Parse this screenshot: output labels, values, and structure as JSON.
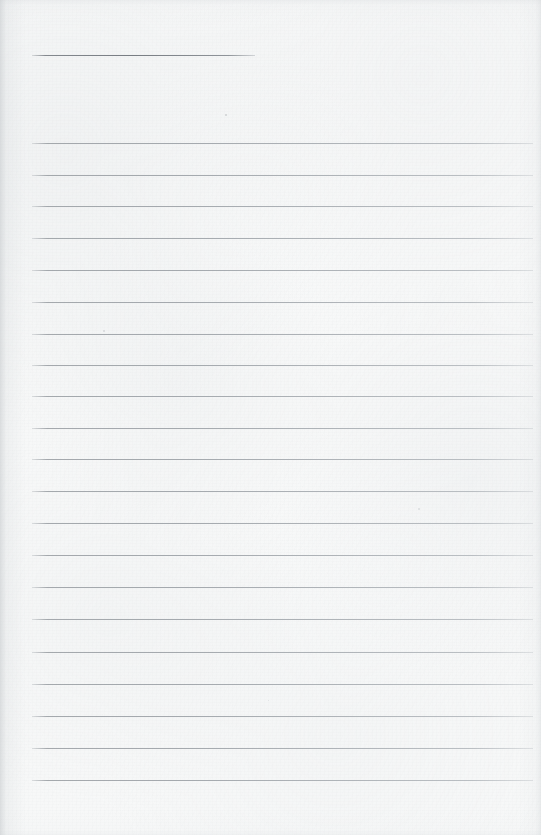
{
  "document": {
    "kind": "lined-notebook-page",
    "title": "",
    "body_text": "",
    "page_width": 541,
    "page_height": 835
  },
  "colors": {
    "paper": "#f7f8f8",
    "paper_shade": "#eceef0",
    "rule_line": "#a6abb0",
    "header_rule_line": "#7c8187",
    "edge_vignette": "#c4c8cb"
  },
  "layout": {
    "rule_left_x": 32,
    "rule_right_x": 533,
    "header_rule": {
      "label": "title-rule",
      "x": 32,
      "y": 55,
      "width": 223,
      "thickness": 1
    },
    "body_rules": {
      "label": "writing-lines",
      "first_y": 143,
      "spacing": 31.85,
      "count": 21,
      "thickness": 1,
      "width": 501
    }
  },
  "rules": [
    {
      "id": "header-rule",
      "type": "header",
      "x": 32,
      "y": 55,
      "width": 223
    },
    {
      "id": "rule-1",
      "type": "body",
      "x": 32,
      "y": 143,
      "width": 501
    },
    {
      "id": "rule-2",
      "type": "body",
      "x": 32,
      "y": 175,
      "width": 501
    },
    {
      "id": "rule-3",
      "type": "body",
      "x": 32,
      "y": 206,
      "width": 501
    },
    {
      "id": "rule-4",
      "type": "body",
      "x": 32,
      "y": 238,
      "width": 501
    },
    {
      "id": "rule-5",
      "type": "body",
      "x": 32,
      "y": 270,
      "width": 501
    },
    {
      "id": "rule-6",
      "type": "body",
      "x": 32,
      "y": 302,
      "width": 501
    },
    {
      "id": "rule-7",
      "type": "body",
      "x": 32,
      "y": 334,
      "width": 501
    },
    {
      "id": "rule-8",
      "type": "body",
      "x": 32,
      "y": 365,
      "width": 501
    },
    {
      "id": "rule-9",
      "type": "body",
      "x": 32,
      "y": 396,
      "width": 501
    },
    {
      "id": "rule-10",
      "type": "body",
      "x": 32,
      "y": 428,
      "width": 501
    },
    {
      "id": "rule-11",
      "type": "body",
      "x": 32,
      "y": 459,
      "width": 501
    },
    {
      "id": "rule-12",
      "type": "body",
      "x": 32,
      "y": 491,
      "width": 501
    },
    {
      "id": "rule-13",
      "type": "body",
      "x": 32,
      "y": 523,
      "width": 501
    },
    {
      "id": "rule-14",
      "type": "body",
      "x": 32,
      "y": 555,
      "width": 501
    },
    {
      "id": "rule-15",
      "type": "body",
      "x": 32,
      "y": 587,
      "width": 501
    },
    {
      "id": "rule-16",
      "type": "body",
      "x": 32,
      "y": 619,
      "width": 501
    },
    {
      "id": "rule-17",
      "type": "body",
      "x": 32,
      "y": 652,
      "width": 501
    },
    {
      "id": "rule-18",
      "type": "body",
      "x": 32,
      "y": 684,
      "width": 501
    },
    {
      "id": "rule-19",
      "type": "body",
      "x": 32,
      "y": 716,
      "width": 501
    },
    {
      "id": "rule-20",
      "type": "body",
      "x": 32,
      "y": 748,
      "width": 501
    },
    {
      "id": "rule-21",
      "type": "body",
      "x": 32,
      "y": 780,
      "width": 501
    }
  ],
  "specks": [
    {
      "x": 225,
      "y": 114,
      "size": 2.0,
      "color": "rgba(176,180,184,0.55)"
    },
    {
      "x": 103,
      "y": 330,
      "size": 1.6,
      "color": "rgba(184,188,192,0.45)"
    },
    {
      "x": 418,
      "y": 508,
      "size": 1.6,
      "color": "rgba(186,190,194,0.40)"
    },
    {
      "x": 268,
      "y": 700,
      "size": 1.4,
      "color": "rgba(190,194,198,0.38)"
    }
  ]
}
